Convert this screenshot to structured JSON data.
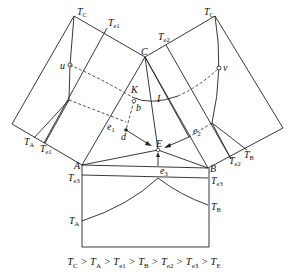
{
  "diagram": {
    "points": {
      "C": "C",
      "A": "A",
      "B": "B",
      "E": "E",
      "K": "K",
      "I": "I",
      "b": "b",
      "d": "d",
      "u": "u",
      "v": "v",
      "e1": "e",
      "e2": "e",
      "e3": "e"
    },
    "left_panel": {
      "TC": "T",
      "Te1": "T",
      "TA": "T",
      "Te1_bottom": "T"
    },
    "right_panel": {
      "TC": "T",
      "Te2": "T",
      "TB": "T",
      "Te2_bottom": "T"
    },
    "bottom_panel": {
      "Te3_left": "T",
      "Te3_right": "T",
      "TA": "T",
      "TB": "T"
    },
    "subscripts": {
      "C": "C",
      "A": "A",
      "B": "B",
      "e1": "e1",
      "e2": "e2",
      "e3": "e3",
      "E": "E",
      "one": "1",
      "two": "2",
      "three": "3"
    },
    "caption": [
      "T",
      "C",
      " > ",
      "T",
      "A",
      " > ",
      "T",
      "e1",
      " > ",
      "T",
      "B",
      " > ",
      "T",
      "e2",
      " > ",
      "T",
      "e3",
      " > ",
      "T",
      "E"
    ]
  }
}
